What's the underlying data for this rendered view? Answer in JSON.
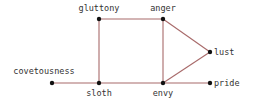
{
  "diagram": {
    "type": "graph",
    "edge_color": "#a86a6a",
    "node_color": "#111111",
    "nodes": [
      {
        "id": "gluttony",
        "label": "gluttony",
        "x": 99,
        "y": 19,
        "lx": 99,
        "ly": 11,
        "anchor": "middle"
      },
      {
        "id": "anger",
        "label": "anger",
        "x": 163,
        "y": 19,
        "lx": 163,
        "ly": 11,
        "anchor": "middle"
      },
      {
        "id": "lust",
        "label": "lust",
        "x": 210,
        "y": 52,
        "lx": 214,
        "ly": 55,
        "anchor": "start"
      },
      {
        "id": "covetousness",
        "label": "covetousness",
        "x": 52,
        "y": 83,
        "lx": 44,
        "ly": 74,
        "anchor": "middle"
      },
      {
        "id": "sloth",
        "label": "sloth",
        "x": 99,
        "y": 83,
        "lx": 99,
        "ly": 96,
        "anchor": "middle"
      },
      {
        "id": "envy",
        "label": "envy",
        "x": 163,
        "y": 83,
        "lx": 163,
        "ly": 96,
        "anchor": "middle"
      },
      {
        "id": "pride",
        "label": "pride",
        "x": 210,
        "y": 83,
        "lx": 214,
        "ly": 86,
        "anchor": "start"
      }
    ],
    "edges": [
      [
        "gluttony",
        "anger"
      ],
      [
        "gluttony",
        "sloth"
      ],
      [
        "anger",
        "envy"
      ],
      [
        "anger",
        "lust"
      ],
      [
        "lust",
        "envy"
      ],
      [
        "covetousness",
        "sloth"
      ],
      [
        "sloth",
        "envy"
      ],
      [
        "envy",
        "pride"
      ]
    ]
  }
}
